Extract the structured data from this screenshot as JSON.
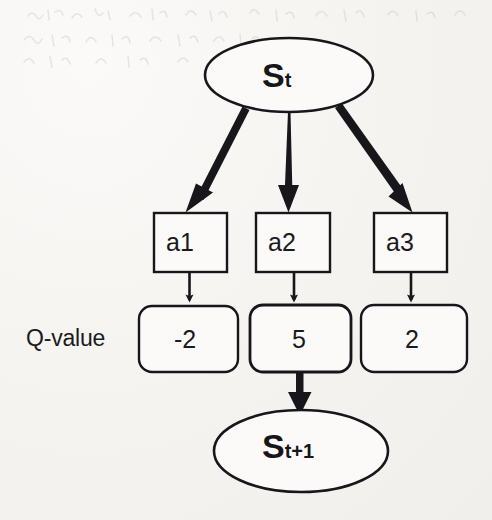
{
  "diagram": {
    "ink_color": "#17161a",
    "paper_color": "#f7f6f4",
    "states": {
      "current": {
        "symbol": "S",
        "subscript": "t",
        "full_label": "St"
      },
      "next": {
        "symbol": "S",
        "subscript": "t+1",
        "full_label": "St+1"
      }
    },
    "row_caption": "Q-value",
    "actions": [
      {
        "label": "a1"
      },
      {
        "label": "a2"
      },
      {
        "label": "a3"
      }
    ],
    "qvalues": [
      {
        "label": "-2",
        "value": -2,
        "selected": false
      },
      {
        "label": "5",
        "value": 5,
        "selected": true
      },
      {
        "label": "2",
        "value": 2,
        "selected": false
      }
    ]
  }
}
